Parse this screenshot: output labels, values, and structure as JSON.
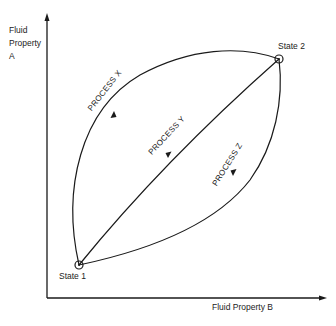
{
  "diagram": {
    "y_axis_label": "Fluid Property A",
    "y_axis_label_lines": [
      "Fluid",
      "Property",
      "A"
    ],
    "x_axis_label": "Fluid Property B",
    "states": [
      {
        "id": "state1",
        "label": "State 1"
      },
      {
        "id": "state2",
        "label": "State 2"
      }
    ],
    "processes": [
      {
        "id": "x",
        "label": "PROCESS X",
        "direction": "state1-to-state2"
      },
      {
        "id": "y",
        "label": "PROCESS Y",
        "direction": "state2-to-state1"
      },
      {
        "id": "z",
        "label": "PROCESS Z",
        "direction": "state2-to-state1"
      }
    ],
    "colors": {
      "line": "#1a1a1a",
      "background": "#ffffff"
    }
  }
}
